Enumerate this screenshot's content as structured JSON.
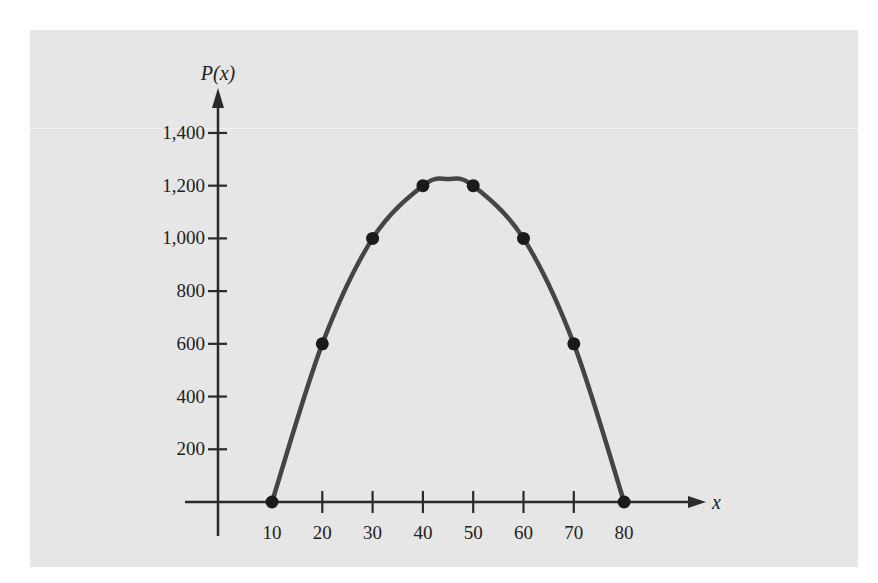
{
  "chart_data": {
    "type": "line",
    "title": "",
    "xlabel": "x",
    "ylabel": "P(x)",
    "x": [
      10,
      20,
      30,
      40,
      50,
      60,
      70,
      80
    ],
    "series": [
      {
        "name": "P(x)",
        "values": [
          0,
          600,
          1000,
          1200,
          1200,
          1000,
          600,
          0
        ],
        "markers": true,
        "smooth": true
      }
    ],
    "peak": {
      "x": 45,
      "y": 1225
    },
    "x_ticks": [
      "10",
      "20",
      "30",
      "40",
      "50",
      "60",
      "70",
      "80"
    ],
    "y_ticks": [
      "200",
      "400",
      "600",
      "800",
      "1,000",
      "1,200",
      "1,400"
    ],
    "xlim": [
      0,
      85
    ],
    "ylim": [
      0,
      1500
    ],
    "grid": false,
    "legend": null
  },
  "colors": {
    "panel_background": "#e6e6e6",
    "curve": "#454545",
    "markers": "#1a1a1a",
    "axes": "#2a2a2a"
  }
}
